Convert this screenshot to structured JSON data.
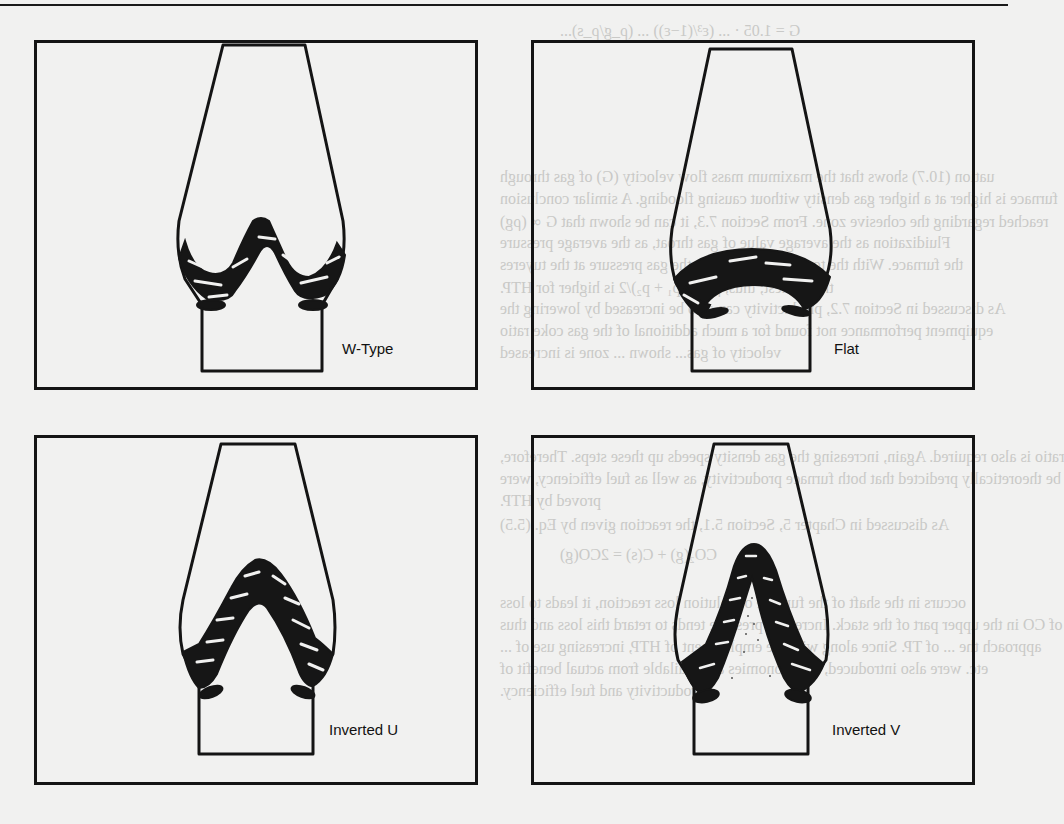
{
  "figure": {
    "panels": [
      {
        "id": "w-type",
        "label": "W-Type",
        "shape": "W",
        "position": "top-left"
      },
      {
        "id": "flat",
        "label": "Flat",
        "shape": "flat-arch",
        "position": "top-right"
      },
      {
        "id": "inverted-u",
        "label": "Inverted U",
        "shape": "inverted-U",
        "position": "bottom-left"
      },
      {
        "id": "inverted-v",
        "label": "Inverted V",
        "shape": "inverted-V",
        "position": "bottom-right"
      }
    ]
  },
  "bleed_through_text": [
    "G = 1.05 · ... (ε³/(1−ε)) ... (ρ_g/ρ_s)...",
    "uation (10.7) shows that the maximum mass flow velocity (G) of gas through",
    "furnace is higher at a higher gas density without causing flooding. A similar conclusion",
    "reached regarding the cohesive zone. From Section 7.3, it can be shown that G ∝ (ρg)",
    "Fluidization as the average value of gas throat, as the average pressure",
    "the furnace. With the top gas pressure (p), the gas pressure at the tuyeres",
    "the highest; thus, ρg ∝ (p₁ + p₂)/2 is higher for HTP.",
    "As discussed in Section 7.2, productivity can also be increased by lowering the",
    "equipment performance not found for a much additional of the gas coke ratio",
    "velocity of gas... shown ... zone is increased",
    "ratio is also required. Again, increasing the gas density speeds up these steps. Therefore,",
    "be theoretically predicted that both furnace productivity, as well as fuel efficiency, were",
    "proved by HTP.",
    "As discussed in Chapter 5, Section 5.1, the reaction given by Eq. (5.5)",
    "CO₂(g) + C(s) = 2CO(g)",
    "occurs in the shaft of the furnace or solution loss reaction, it leads to loss",
    "of CO in the upper part of the stack. Increased pressure tends to retard this loss and thus",
    "approach the ... of TP. Since along with the employment of HTP, increasing use of ... ",
    "etc. were also introduced, the economies are available from actual benefit of",
    "productivity and fuel efficiency."
  ]
}
